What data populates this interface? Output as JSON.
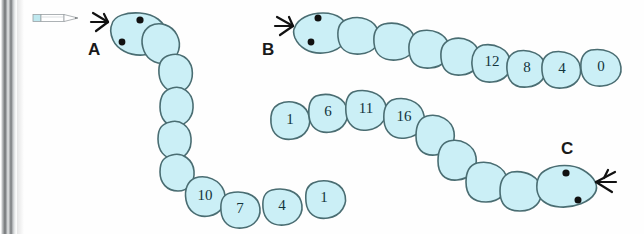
{
  "page": {
    "background_color": "#fefefe",
    "binding_color": "#8d9092",
    "segment_fill": "#cbeff6",
    "segment_stroke": "#4a6d72",
    "ink_color": "#111111"
  },
  "cursor": {
    "name": "pencil-cursor",
    "tip_color": "#9aa0a3",
    "eraser_color": "#bfe8ef"
  },
  "worms": [
    {
      "id": "a",
      "label": "A",
      "head_position": "upper-left",
      "numbered_segments": [
        "10",
        "7",
        "4",
        "1"
      ],
      "sequence_step": "-3",
      "plain_segments": 6
    },
    {
      "id": "b",
      "label": "B",
      "head_position": "upper-left",
      "numbered_segments": [
        "12",
        "8",
        "4",
        "0"
      ],
      "sequence_step": "-4",
      "plain_segments": 4
    },
    {
      "id": "c",
      "label": "C",
      "head_position": "lower-right",
      "numbered_segments": [
        "1",
        "6",
        "11",
        "16"
      ],
      "sequence_step": "+5",
      "plain_segments": 5
    }
  ]
}
